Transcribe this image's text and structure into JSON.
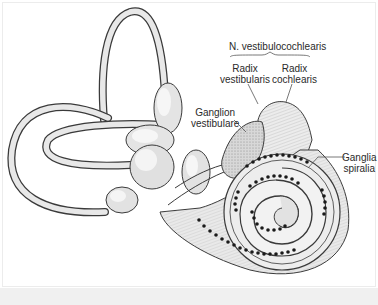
{
  "figure": {
    "labels": {
      "nerve": "N. vestibulocochlearis",
      "radix_vestibularis": [
        "Radix",
        "vestibularis"
      ],
      "radix_cochlearis": [
        "Radix",
        "cochlearis"
      ],
      "ganglion_vestibulare": [
        "Ganglion",
        "vestibulare"
      ],
      "ganglia_spiralia": [
        "Ganglia",
        "spiralia"
      ]
    },
    "colors": {
      "background": "#ffffff",
      "structure_fill": "#e6e6e6",
      "structure_highlight": "#f4f4f4",
      "outline": "#3a3a3a",
      "ganglion_dots": "#1a1a1a",
      "label_text": "#2a2a2a",
      "leader_lines": "#555555",
      "caption_strip": "#f0f0f0"
    }
  }
}
